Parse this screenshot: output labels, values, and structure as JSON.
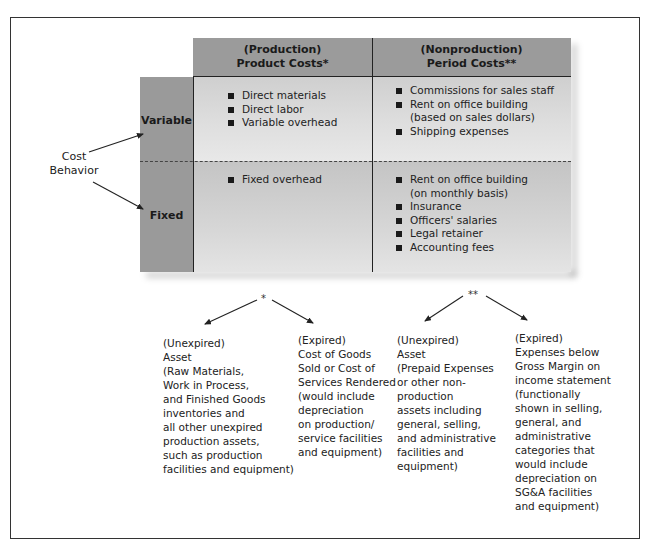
{
  "diagram": {
    "columns": [
      {
        "line1": "(Production)",
        "line2": "Product Costs*"
      },
      {
        "line1": "(Nonproduction)",
        "line2": "Period Costs**"
      }
    ],
    "rows": [
      {
        "label": "Variable"
      },
      {
        "label": "Fixed"
      }
    ],
    "row_axis_label": {
      "line1": "Cost",
      "line2": "Behavior"
    },
    "cells": {
      "variable_product": [
        "Direct materials",
        "Direct labor",
        "Variable overhead"
      ],
      "variable_period": [
        "Commissions for sales staff",
        "Rent on office building\n(based on sales dollars)",
        "Shipping expenses"
      ],
      "fixed_product": [
        "Fixed overhead"
      ],
      "fixed_period": [
        "Rent on office building\n(on monthly basis)",
        "Insurance",
        "Officers' salaries",
        "Legal retainer",
        "Accounting fees"
      ]
    },
    "footnotes": {
      "product_marker": "*",
      "period_marker": "**",
      "product_unexpired": "(Unexpired)\nAsset\n(Raw Materials,\nWork in Process,\nand Finished Goods\ninventories and\nall other unexpired\nproduction assets,\nsuch as production\nfacilities and equipment)",
      "product_expired": "(Expired)\nCost of Goods\nSold or Cost of\nServices Rendered\n(would include\ndepreciation\non production/\nservice facilities\nand equipment)",
      "period_unexpired": "(Unexpired)\nAsset\n(Prepaid Expenses\nor other non-\nproduction\nassets including\ngeneral, selling,\nand administrative\nfacilities and\nequipment)",
      "period_expired": "(Expired)\nExpenses below\nGross Margin on\nincome statement\n(functionally\nshown in selling,\ngeneral, and\nadministrative\ncategories that\nwould include\ndepreciation on\nSG&A facilities\nand equipment)"
    },
    "colors": {
      "header_fill": "#9b9b9b",
      "label_fill": "#9a9a9a",
      "variable_cell_fill": "#d8d8d8",
      "fixed_cell_fill": "#cfcfcf",
      "frame_border": "#333333"
    }
  }
}
